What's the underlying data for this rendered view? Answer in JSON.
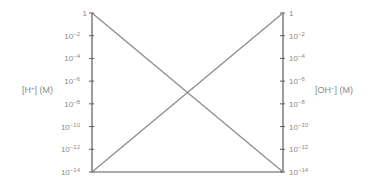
{
  "chart_data": {
    "type": "line",
    "title": "",
    "y_scale": "log",
    "left_axis": {
      "label": "[H⁺] (M)",
      "label_base": "[H",
      "label_sup": "+",
      "label_tail": "] (M)",
      "ticks": [
        {
          "base": "1",
          "exp": ""
        },
        {
          "base": "10",
          "exp": "−2"
        },
        {
          "base": "10",
          "exp": "−4"
        },
        {
          "base": "10",
          "exp": "−6"
        },
        {
          "base": "10",
          "exp": "−8"
        },
        {
          "base": "10",
          "exp": "−10"
        },
        {
          "base": "10",
          "exp": "−12"
        },
        {
          "base": "10",
          "exp": "−14"
        }
      ],
      "ylim": [
        1e-14,
        1
      ]
    },
    "right_axis": {
      "label": "[OH⁻] (M)",
      "label_base": "[OH",
      "label_sup": "−",
      "label_tail": "] (M)",
      "ticks": [
        {
          "base": "1",
          "exp": ""
        },
        {
          "base": "10",
          "exp": "−2"
        },
        {
          "base": "10",
          "exp": "−4"
        },
        {
          "base": "10",
          "exp": "−6"
        },
        {
          "base": "10",
          "exp": "−8"
        },
        {
          "base": "10",
          "exp": "−10"
        },
        {
          "base": "10",
          "exp": "−12"
        },
        {
          "base": "10",
          "exp": "−14"
        }
      ],
      "ylim": [
        1e-14,
        1
      ]
    },
    "x": [
      0,
      1
    ],
    "series": [
      {
        "name": "[H⁺]",
        "axis": "left",
        "values_log10": [
          0,
          -14
        ]
      },
      {
        "name": "[OH⁻]",
        "axis": "right",
        "values_log10": [
          -14,
          0
        ]
      }
    ],
    "intersection_log10": -7,
    "grid": false,
    "legend": "none"
  },
  "colors": {
    "axis": "#5a5a5a",
    "series": "#8c8c8c",
    "text": "#8a8a8a"
  }
}
